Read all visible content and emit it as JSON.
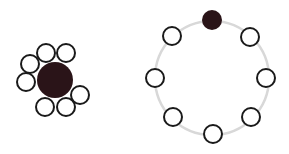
{
  "diagram": {
    "colors": {
      "dark_fill": "#2a1418",
      "outline": "#1a1a1a",
      "ring": "#d8d8d8",
      "background": "#ffffff"
    },
    "clustered": {
      "center_node": {
        "cx": 55,
        "cy": 80,
        "r": 18
      },
      "satellites": [
        {
          "cx": 46,
          "cy": 53
        },
        {
          "cx": 66,
          "cy": 53
        },
        {
          "cx": 30,
          "cy": 64
        },
        {
          "cx": 26,
          "cy": 82
        },
        {
          "cx": 45,
          "cy": 107
        },
        {
          "cx": 66,
          "cy": 107
        },
        {
          "cx": 80,
          "cy": 95
        }
      ],
      "satellite_r": 9
    },
    "ring": {
      "cx": 212,
      "cy": 78,
      "r": 57,
      "hub_node": {
        "cx": 212,
        "cy": 20,
        "r": 10
      },
      "nodes": [
        {
          "cx": 250,
          "cy": 37
        },
        {
          "cx": 266,
          "cy": 78
        },
        {
          "cx": 251,
          "cy": 117
        },
        {
          "cx": 213,
          "cy": 134
        },
        {
          "cx": 173,
          "cy": 117
        },
        {
          "cx": 155,
          "cy": 78
        },
        {
          "cx": 172,
          "cy": 36
        }
      ],
      "node_r": 9
    }
  }
}
